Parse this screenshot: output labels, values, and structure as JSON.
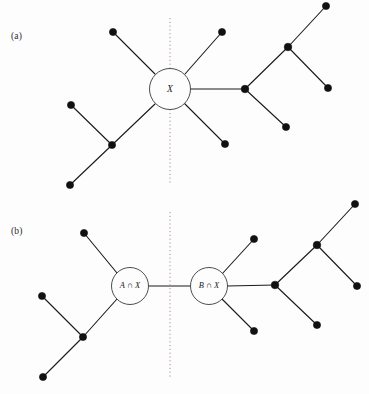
{
  "figure": {
    "background_color": "#fdfdfd",
    "edge_color": "#1a1a1a",
    "node_color": "#111111",
    "divider_color": "#b08b84",
    "panels": [
      {
        "id": "a",
        "label": "(a)",
        "divider_x": 170,
        "divider_y1": 18,
        "divider_y2": 183,
        "hubs": [
          {
            "name": "hub-x",
            "label": "X",
            "cx": 170,
            "cy": 89,
            "r": 20.5,
            "single": true
          }
        ],
        "nodes": [
          {
            "name": "leaf-upper-left",
            "cx": 113,
            "cy": 32,
            "r": 3.6
          },
          {
            "name": "leaf-upper-right",
            "cx": 222,
            "cy": 32,
            "r": 3.6
          },
          {
            "name": "branch-junction-left",
            "cx": 112,
            "cy": 145,
            "r": 3.6
          },
          {
            "name": "leaf-left-upper",
            "cx": 71,
            "cy": 105,
            "r": 3.6
          },
          {
            "name": "leaf-left-lower",
            "cx": 70,
            "cy": 185,
            "r": 3.6
          },
          {
            "name": "leaf-lower-right",
            "cx": 225,
            "cy": 144,
            "r": 3.6
          },
          {
            "name": "hub-right",
            "cx": 245,
            "cy": 89,
            "r": 3.8
          },
          {
            "name": "branch-junction-right",
            "cx": 288,
            "cy": 47,
            "r": 3.8
          },
          {
            "name": "leaf-far-upper-right",
            "cx": 326,
            "cy": 6,
            "r": 3.6
          },
          {
            "name": "leaf-far-mid-right",
            "cx": 328,
            "cy": 88,
            "r": 3.6
          },
          {
            "name": "leaf-far-lower-right",
            "cx": 286,
            "cy": 127,
            "r": 3.6
          }
        ],
        "edges": [
          {
            "name": "edge-hub-to-upper-left",
            "x1": 155,
            "y1": 74,
            "x2": 113,
            "y2": 32
          },
          {
            "name": "edge-hub-to-upper-right",
            "x1": 185,
            "y1": 74,
            "x2": 222,
            "y2": 32
          },
          {
            "name": "edge-hub-to-lower-left",
            "x1": 155,
            "y1": 104,
            "x2": 112,
            "y2": 145
          },
          {
            "name": "edge-hub-to-lower-right",
            "x1": 184,
            "y1": 103,
            "x2": 225,
            "y2": 144
          },
          {
            "name": "edge-hub-to-right-hub",
            "x1": 190,
            "y1": 89,
            "x2": 245,
            "y2": 89
          },
          {
            "name": "edge-left-junction-to-leaf-up",
            "x1": 112,
            "y1": 145,
            "x2": 71,
            "y2": 105
          },
          {
            "name": "edge-left-junction-to-leaf-down",
            "x1": 112,
            "y1": 145,
            "x2": 70,
            "y2": 185
          },
          {
            "name": "edge-right-hub-to-junction",
            "x1": 245,
            "y1": 89,
            "x2": 288,
            "y2": 47
          },
          {
            "name": "edge-right-hub-to-leaf-lower",
            "x1": 245,
            "y1": 89,
            "x2": 286,
            "y2": 127
          },
          {
            "name": "edge-right-junction-to-far-upper",
            "x1": 288,
            "y1": 47,
            "x2": 326,
            "y2": 6
          },
          {
            "name": "edge-right-junction-to-far-mid",
            "x1": 288,
            "y1": 47,
            "x2": 328,
            "y2": 88
          }
        ]
      },
      {
        "id": "b",
        "label": "(b)",
        "divider_x": 170,
        "divider_y1": 212,
        "divider_y2": 378,
        "hubs": [
          {
            "name": "hub-a-intersect-x",
            "label": "A ∩ X",
            "cx": 130,
            "cy": 286,
            "r": 18.5,
            "single": false
          },
          {
            "name": "hub-b-intersect-x",
            "label": "B ∩ X",
            "cx": 209,
            "cy": 286,
            "r": 18.5,
            "single": false
          }
        ],
        "nodes": [
          {
            "name": "leaf-upper-left",
            "cx": 84,
            "cy": 233,
            "r": 3.6
          },
          {
            "name": "branch-junction-left",
            "cx": 83,
            "cy": 337,
            "r": 3.6
          },
          {
            "name": "leaf-left-upper",
            "cx": 42,
            "cy": 296,
            "r": 3.6
          },
          {
            "name": "leaf-left-lower",
            "cx": 43,
            "cy": 377,
            "r": 3.6
          },
          {
            "name": "leaf-b-upper-right",
            "cx": 254,
            "cy": 239,
            "r": 3.6
          },
          {
            "name": "leaf-b-lower-right",
            "cx": 254,
            "cy": 331,
            "r": 3.6
          },
          {
            "name": "hub-right",
            "cx": 275,
            "cy": 285,
            "r": 3.8
          },
          {
            "name": "branch-junction-right",
            "cx": 317,
            "cy": 245,
            "r": 3.8
          },
          {
            "name": "leaf-far-upper-right",
            "cx": 355,
            "cy": 204,
            "r": 3.6
          },
          {
            "name": "leaf-far-mid-right",
            "cx": 357,
            "cy": 286,
            "r": 3.6
          },
          {
            "name": "leaf-far-lower-right",
            "cx": 317,
            "cy": 325,
            "r": 3.6
          }
        ],
        "edges": [
          {
            "name": "edge-a-hub-to-upper-left",
            "x1": 117,
            "y1": 273,
            "x2": 84,
            "y2": 233
          },
          {
            "name": "edge-a-hub-to-lower-left",
            "x1": 117,
            "y1": 299,
            "x2": 83,
            "y2": 337
          },
          {
            "name": "edge-a-hub-to-b-hub",
            "x1": 148,
            "y1": 286,
            "x2": 191,
            "y2": 286
          },
          {
            "name": "edge-left-junction-to-leaf-up",
            "x1": 83,
            "y1": 337,
            "x2": 42,
            "y2": 296
          },
          {
            "name": "edge-left-junction-to-leaf-down",
            "x1": 83,
            "y1": 337,
            "x2": 43,
            "y2": 377
          },
          {
            "name": "edge-b-hub-to-upper-right",
            "x1": 222,
            "y1": 274,
            "x2": 254,
            "y2": 239
          },
          {
            "name": "edge-b-hub-to-lower-right",
            "x1": 222,
            "y1": 299,
            "x2": 254,
            "y2": 331
          },
          {
            "name": "edge-b-hub-to-right-hub",
            "x1": 227,
            "y1": 286,
            "x2": 275,
            "y2": 285
          },
          {
            "name": "edge-right-hub-to-junction",
            "x1": 275,
            "y1": 285,
            "x2": 317,
            "y2": 245
          },
          {
            "name": "edge-right-hub-to-leaf-lower",
            "x1": 275,
            "y1": 285,
            "x2": 317,
            "y2": 325
          },
          {
            "name": "edge-right-junction-to-far-upper",
            "x1": 317,
            "y1": 245,
            "x2": 355,
            "y2": 204
          },
          {
            "name": "edge-right-junction-to-far-mid",
            "x1": 317,
            "y1": 245,
            "x2": 357,
            "y2": 286
          }
        ]
      }
    ]
  }
}
